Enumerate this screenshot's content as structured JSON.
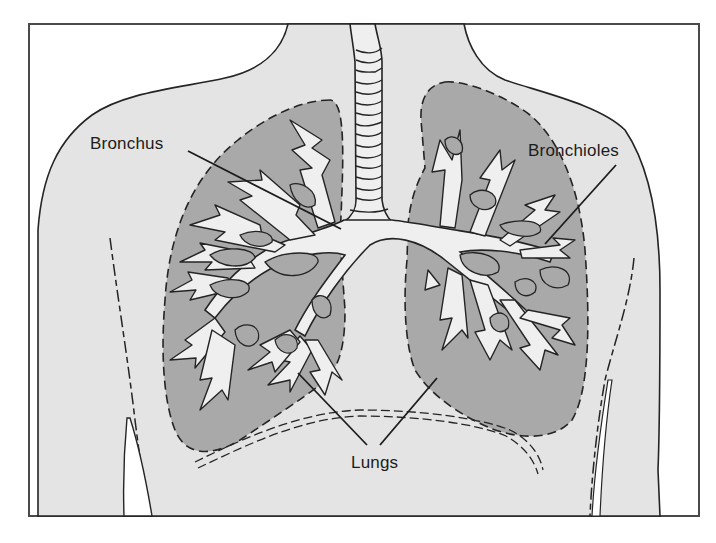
{
  "figure": {
    "colors": {
      "page_background": "#ffffff",
      "frame_stroke": "#4a4a4a",
      "body_fill": "#e4e4e4",
      "lung_fill": "#a9a9a9",
      "airway_fill": "#efefef",
      "outline_stroke": "#242424"
    }
  },
  "labels": {
    "bronchus": "Bronchus",
    "bronchioles": "Bronchioles",
    "lungs": "Lungs"
  }
}
